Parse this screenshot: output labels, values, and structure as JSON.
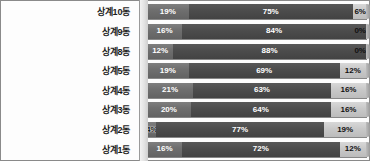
{
  "chart_data": {
    "type": "bar",
    "subtype": "stacked-horizontal-100pct",
    "title": "",
    "xlabel": "",
    "ylabel": "",
    "xlim": [
      0,
      100
    ],
    "grid": false,
    "legend": "none",
    "categories": [
      "상계10동",
      "상계9동",
      "상계8동",
      "상계5동",
      "상계4동",
      "상계3동",
      "상계2동",
      "상계1동"
    ],
    "series": [
      {
        "name": "series-1",
        "values": [
          19,
          16,
          12,
          19,
          21,
          20,
          4,
          16
        ]
      },
      {
        "name": "series-2",
        "values": [
          75,
          84,
          88,
          69,
          63,
          64,
          77,
          72
        ]
      },
      {
        "name": "series-3",
        "values": [
          6,
          0,
          0,
          12,
          16,
          16,
          19,
          12
        ]
      }
    ],
    "value_labels": [
      [
        "19%",
        "75%",
        "6%"
      ],
      [
        "16%",
        "84%",
        "0%"
      ],
      [
        "12%",
        "88%",
        "0%"
      ],
      [
        "19%",
        "69%",
        "12%"
      ],
      [
        "21%",
        "63%",
        "16%"
      ],
      [
        "20%",
        "64%",
        "16%"
      ],
      [
        "4%",
        "77%",
        "19%"
      ],
      [
        "16%",
        "72%",
        "12%"
      ]
    ],
    "colors": {
      "series_1": "#6f6f6f",
      "series_2": "#4c4c4c",
      "series_3": "#c8c8c8",
      "axis_wall": "#e2e2e2",
      "frame": "#8a8a8a",
      "background": "#fdfdfd"
    }
  },
  "rows": [
    {
      "label": "상계10동",
      "segments": [
        {
          "value": 19,
          "text": "19%"
        },
        {
          "value": 75,
          "text": "75%"
        },
        {
          "value": 6,
          "text": "6%"
        }
      ]
    },
    {
      "label": "상계9동",
      "segments": [
        {
          "value": 16,
          "text": "16%"
        },
        {
          "value": 84,
          "text": "84%"
        },
        {
          "value": 0,
          "text": "0%"
        }
      ]
    },
    {
      "label": "상계8동",
      "segments": [
        {
          "value": 12,
          "text": "12%"
        },
        {
          "value": 88,
          "text": "88%"
        },
        {
          "value": 0,
          "text": "0%"
        }
      ]
    },
    {
      "label": "상계5동",
      "segments": [
        {
          "value": 19,
          "text": "19%"
        },
        {
          "value": 69,
          "text": "69%"
        },
        {
          "value": 12,
          "text": "12%"
        }
      ]
    },
    {
      "label": "상계4동",
      "segments": [
        {
          "value": 21,
          "text": "21%"
        },
        {
          "value": 63,
          "text": "63%"
        },
        {
          "value": 16,
          "text": "16%"
        }
      ]
    },
    {
      "label": "상계3동",
      "segments": [
        {
          "value": 20,
          "text": "20%"
        },
        {
          "value": 64,
          "text": "64%"
        },
        {
          "value": 16,
          "text": "16%"
        }
      ]
    },
    {
      "label": "상계2동",
      "segments": [
        {
          "value": 4,
          "text": "4%"
        },
        {
          "value": 77,
          "text": "77%"
        },
        {
          "value": 19,
          "text": "19%"
        }
      ]
    },
    {
      "label": "상계1동",
      "segments": [
        {
          "value": 16,
          "text": "16%"
        },
        {
          "value": 72,
          "text": "72%"
        },
        {
          "value": 12,
          "text": "12%"
        }
      ]
    }
  ]
}
